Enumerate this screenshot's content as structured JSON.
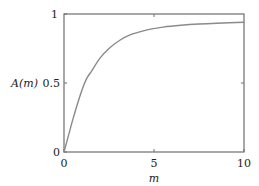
{
  "chart_data": {
    "type": "line",
    "title": "",
    "xlabel": "m",
    "ylabel": "A(m)",
    "xlim": [
      0,
      10
    ],
    "ylim": [
      0,
      1
    ],
    "x_ticks": [
      0,
      5,
      10
    ],
    "x_tick_labels": [
      "0",
      "5",
      "10"
    ],
    "y_ticks": [
      0,
      0.5,
      1
    ],
    "y_tick_labels": [
      "0",
      "0.5",
      "1"
    ],
    "grid": false,
    "legend": null,
    "series": [
      {
        "name": "A(m)",
        "color": "#8a8a8a",
        "x": [
          0,
          0.25,
          0.5,
          0.75,
          1.0,
          1.25,
          1.55,
          2.0,
          2.5,
          3.1,
          3.7,
          4.2,
          4.8,
          5.5,
          6.5,
          7.5,
          8.5,
          10.0
        ],
        "y": [
          0,
          0.12,
          0.24,
          0.35,
          0.45,
          0.53,
          0.59,
          0.68,
          0.75,
          0.81,
          0.85,
          0.87,
          0.89,
          0.905,
          0.918,
          0.927,
          0.933,
          0.94
        ]
      }
    ]
  },
  "labels": {
    "ylabel_text": "A(m)",
    "xlabel_text": "m",
    "ytick_0": "0",
    "ytick_05": "0.5",
    "ytick_1": "1",
    "xtick_0": "0",
    "xtick_5": "5",
    "xtick_10": "10"
  },
  "colors": {
    "frame": "#6e6e6e",
    "curve": "#8a8a8a"
  }
}
